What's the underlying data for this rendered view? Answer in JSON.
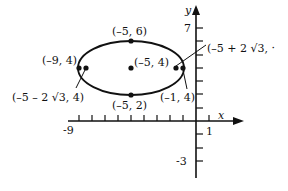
{
  "diagram": {
    "type": "ellipse-on-coordinate-plane",
    "axes": {
      "x_label": "x",
      "y_label": "y",
      "x_tick_labels": [
        "-9",
        "1"
      ],
      "y_tick_labels": [
        "7",
        "-3"
      ]
    },
    "ellipse": {
      "center": [
        -5,
        4
      ],
      "semi_major": 4,
      "semi_minor": 2
    },
    "points": [
      {
        "label": "(–5, 6)",
        "x": -5,
        "y": 6
      },
      {
        "label": "(–5, 4)",
        "x": -5,
        "y": 4
      },
      {
        "label": "(–5, 2)",
        "x": -5,
        "y": 2
      },
      {
        "label": "(–9, 4)",
        "x": -9,
        "y": 4
      },
      {
        "label": "(–1, 4)",
        "x": -1,
        "y": 4
      },
      {
        "label": "(–5 – 2 √3, 4)",
        "x": -8.464,
        "y": 4
      },
      {
        "label": "(–5 + 2 √3, ·",
        "x": -1.536,
        "y": 4
      }
    ],
    "colors": {
      "ink": "#111111",
      "background": "#ffffff"
    }
  }
}
